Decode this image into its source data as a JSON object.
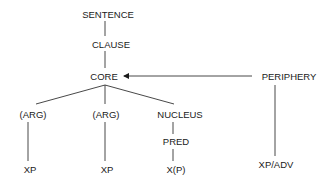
{
  "diagram": {
    "type": "tree",
    "nodes": {
      "sentence": "SENTENCE",
      "clause": "CLAUSE",
      "core": "CORE",
      "periphery": "PERIPHERY",
      "arg1": "(ARG)",
      "arg2": "(ARG)",
      "nucleus": "NUCLEUS",
      "pred": "PRED",
      "xp1": "XP",
      "xp2": "XP",
      "xp3": "X(P)",
      "xpadv": "XP/ADV"
    },
    "edges": [
      {
        "from": "sentence",
        "to": "clause"
      },
      {
        "from": "clause",
        "to": "core"
      },
      {
        "from": "core",
        "to": "arg1"
      },
      {
        "from": "core",
        "to": "arg2"
      },
      {
        "from": "core",
        "to": "nucleus"
      },
      {
        "from": "nucleus",
        "to": "pred"
      },
      {
        "from": "pred",
        "to": "xp3"
      },
      {
        "from": "arg1",
        "to": "xp1"
      },
      {
        "from": "arg2",
        "to": "xp2"
      },
      {
        "from": "periphery",
        "to": "core",
        "style": "arrow"
      },
      {
        "from": "periphery",
        "to": "xpadv"
      }
    ]
  }
}
